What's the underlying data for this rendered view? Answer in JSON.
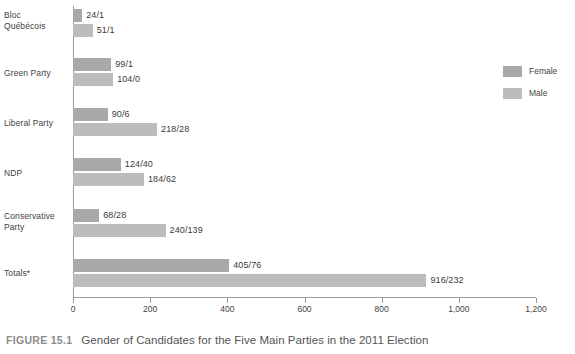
{
  "figure": {
    "tag": "FIGURE 15.1",
    "caption": "Gender of Candidates for the Five Main Parties in the 2011 Election"
  },
  "legend": {
    "position": "right",
    "items": [
      {
        "label": "Female",
        "color": "#a9a9a9"
      },
      {
        "label": "Male",
        "color": "#bcbcbc"
      }
    ]
  },
  "axis": {
    "ticks": [
      "0",
      "200",
      "400",
      "600",
      "800",
      "1,000",
      "1,200"
    ]
  },
  "chart_data": {
    "type": "bar",
    "orientation": "horizontal",
    "title": "Gender of Candidates for the Five Main Parties in the 2011 Election",
    "xlabel": "",
    "ylabel": "",
    "xlim": [
      0,
      1200
    ],
    "grid": false,
    "legend_position": "right",
    "categories": [
      "Bloc Québécois",
      "Green Party",
      "Liberal Party",
      "NDP",
      "Conservative Party",
      "Totals*"
    ],
    "series": [
      {
        "name": "Female",
        "color": "#a9a9a9",
        "values": [
          24,
          99,
          90,
          124,
          68,
          405
        ],
        "elected": [
          1,
          1,
          6,
          40,
          28,
          76
        ],
        "labels": [
          "24/1",
          "99/1",
          "90/6",
          "124/40",
          "68/28",
          "405/76"
        ]
      },
      {
        "name": "Male",
        "color": "#bcbcbc",
        "values": [
          51,
          104,
          218,
          184,
          240,
          916
        ],
        "elected": [
          1,
          0,
          28,
          62,
          139,
          232
        ],
        "labels": [
          "51/1",
          "104/0",
          "218/28",
          "184/62",
          "240/139",
          "916/232"
        ]
      }
    ],
    "label_format": "candidates/elected"
  },
  "rows": [
    {
      "category_line1": "Bloc",
      "category_line2": "Québécois",
      "label_top": 10,
      "female": {
        "value": 24,
        "label": "24/1",
        "top": 9
      },
      "male": {
        "value": 51,
        "label": "51/1",
        "top": 24
      }
    },
    {
      "category_line1": "Green Party",
      "category_line2": "",
      "label_top": 68,
      "female": {
        "value": 99,
        "label": "99/1",
        "top": 58
      },
      "male": {
        "value": 104,
        "label": "104/0",
        "top": 73
      }
    },
    {
      "category_line1": "Liberal Party",
      "category_line2": "",
      "label_top": 118,
      "female": {
        "value": 90,
        "label": "90/6",
        "top": 108
      },
      "male": {
        "value": 218,
        "label": "218/28",
        "top": 123
      }
    },
    {
      "category_line1": "NDP",
      "category_line2": "",
      "label_top": 168,
      "female": {
        "value": 124,
        "label": "124/40",
        "top": 158
      },
      "male": {
        "value": 184,
        "label": "184/62",
        "top": 173
      }
    },
    {
      "category_line1": "Conservative",
      "category_line2": "Party",
      "label_top": 211,
      "female": {
        "value": 68,
        "label": "68/28",
        "top": 209
      },
      "male": {
        "value": 240,
        "label": "240/139",
        "top": 224
      }
    },
    {
      "category_line1": "Totals*",
      "category_line2": "",
      "label_top": 268,
      "female": {
        "value": 405,
        "label": "405/76",
        "top": 259
      },
      "male": {
        "value": 916,
        "label": "916/232",
        "top": 274
      }
    }
  ]
}
